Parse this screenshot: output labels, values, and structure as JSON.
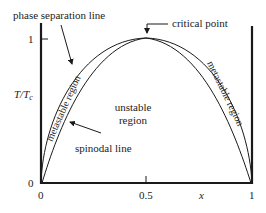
{
  "diagram": {
    "axes": {
      "x_label": "x",
      "y_label_main": "T/T",
      "y_label_sub": "c",
      "x_ticks": [
        "0",
        "0.5",
        "1"
      ],
      "y_ticks": [
        "0",
        "1"
      ]
    },
    "labels": {
      "phase_separation_line": "phase separation line",
      "critical_point": "critical point",
      "spinodal_line": "spinodal line",
      "unstable_region_line1": "unstable",
      "unstable_region_line2": "region",
      "metastable_left": "metastable region",
      "metastable_right": "metastable region"
    },
    "colors": {
      "line": "#1a1a1a",
      "text": "#222222",
      "background": "#ffffff"
    }
  }
}
